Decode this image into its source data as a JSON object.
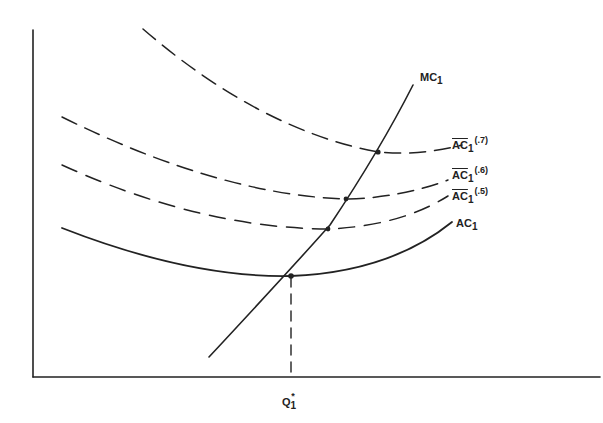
{
  "diagram": {
    "type": "cost curves",
    "axes": {
      "x_label": "",
      "y_label": ""
    },
    "curves": [
      {
        "id": "MC1",
        "label_main": "MC",
        "label_sub": "1",
        "style": "solid"
      },
      {
        "id": "AC1_7",
        "label_main": "AC",
        "label_sub": "1",
        "label_sup": "(.7)",
        "style": "dashed",
        "overbar": true
      },
      {
        "id": "AC1_6",
        "label_main": "AC",
        "label_sub": "1",
        "label_sup": "(.6)",
        "style": "dashed",
        "overbar": true
      },
      {
        "id": "AC1_5",
        "label_main": "AC",
        "label_sub": "1",
        "label_sup": "(.5)",
        "style": "dashed",
        "overbar": true
      },
      {
        "id": "AC1",
        "label_main": "AC",
        "label_sub": "1",
        "style": "solid"
      }
    ],
    "x_marker": {
      "label_main": "Q",
      "label_sub": "1",
      "label_sup": "*"
    }
  },
  "colors": {
    "line": "#222222",
    "background": "#ffffff"
  }
}
